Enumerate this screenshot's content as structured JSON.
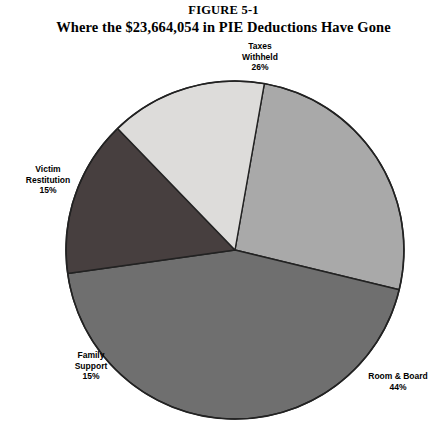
{
  "figure": {
    "number": "FIGURE 5-1",
    "caption": "Where the $23,664,054 in PIE Deductions Have Gone"
  },
  "chart_data": {
    "type": "pie",
    "title": "Where the $23,664,054 in PIE Deductions Have Gone",
    "subtitle": "FIGURE 5-1",
    "total_amount": "$23,664,054",
    "legend": "none",
    "labels_position": "outside",
    "categories": [
      "Taxes Withheld",
      "Room & Board",
      "Family Support",
      "Victim Restitution"
    ],
    "values": [
      26,
      44,
      15,
      15
    ],
    "unit": "%",
    "slices": [
      {
        "label": "Taxes Withheld",
        "label_line1": "Taxes",
        "label_line2": "Withheld",
        "value": 26,
        "value_text": "26%",
        "color": "#a9a9a9",
        "start_angle": -80,
        "end_angle": 13.6
      },
      {
        "label": "Room & Board",
        "label_line1": "Room & Board",
        "label_line2": "",
        "value": 44,
        "value_text": "44%",
        "color": "#6f6f6f",
        "start_angle": 13.6,
        "end_angle": 172
      },
      {
        "label": "Family Support",
        "label_line1": "Family",
        "label_line2": "Support",
        "value": 15,
        "value_text": "15%",
        "color": "#473f3f",
        "start_angle": 172,
        "end_angle": 226
      },
      {
        "label": "Victim Restitution",
        "label_line1": "Victim",
        "label_line2": "Restitution",
        "value": 15,
        "value_text": "15%",
        "color": "#dddcda",
        "start_angle": 226,
        "end_angle": 280
      }
    ],
    "geometry": {
      "center_x": 235,
      "center_y": 250,
      "radius": 169
    },
    "outline_color": "#222222"
  }
}
